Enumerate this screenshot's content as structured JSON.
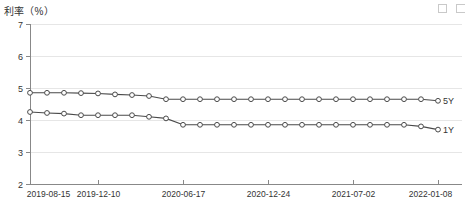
{
  "chart_title": "利率（%）",
  "toolbar": {
    "buttons": [
      {
        "name": "restore-icon",
        "label": ""
      },
      {
        "name": "maximize-icon",
        "label": ""
      }
    ]
  },
  "series_labels": {
    "five_year": "5Y",
    "one_year": "1Y"
  },
  "chart_data": {
    "type": "line",
    "title": "利率（%）",
    "xlabel": "",
    "ylabel": "利率（%）",
    "ylim": [
      2,
      7
    ],
    "yticks": [
      7,
      6,
      5,
      4,
      3,
      2
    ],
    "grid": true,
    "legend_position": "right-inline",
    "x_tick_labels": [
      "2019-08-15",
      "2019-12-10",
      "2020-06-17",
      "2020-12-24",
      "2021-07-02",
      "2022-01-08"
    ],
    "x_tick_indices": [
      0,
      4,
      9,
      14,
      19,
      24
    ],
    "x": [
      "2019-08-15",
      "2019-09-20",
      "2019-10-21",
      "2019-11-20",
      "2019-12-10",
      "2020-01-20",
      "2020-02-20",
      "2020-03-20",
      "2020-04-20",
      "2020-06-17",
      "2020-07-20",
      "2020-08-20",
      "2020-09-21",
      "2020-10-20",
      "2020-12-24",
      "2021-01-20",
      "2021-02-22",
      "2021-03-22",
      "2021-04-20",
      "2021-07-02",
      "2021-08-20",
      "2021-09-22",
      "2021-10-20",
      "2021-12-20",
      "2022-01-08"
    ],
    "series": [
      {
        "name": "5Y",
        "values": [
          4.85,
          4.85,
          4.85,
          4.84,
          4.83,
          4.8,
          4.78,
          4.75,
          4.65,
          4.65,
          4.65,
          4.65,
          4.65,
          4.65,
          4.65,
          4.65,
          4.65,
          4.65,
          4.65,
          4.65,
          4.65,
          4.65,
          4.65,
          4.65,
          4.6
        ]
      },
      {
        "name": "1Y",
        "values": [
          4.25,
          4.22,
          4.2,
          4.15,
          4.15,
          4.15,
          4.15,
          4.1,
          4.05,
          3.85,
          3.85,
          3.85,
          3.85,
          3.85,
          3.85,
          3.85,
          3.85,
          3.85,
          3.85,
          3.85,
          3.85,
          3.85,
          3.85,
          3.8,
          3.7
        ]
      }
    ]
  }
}
